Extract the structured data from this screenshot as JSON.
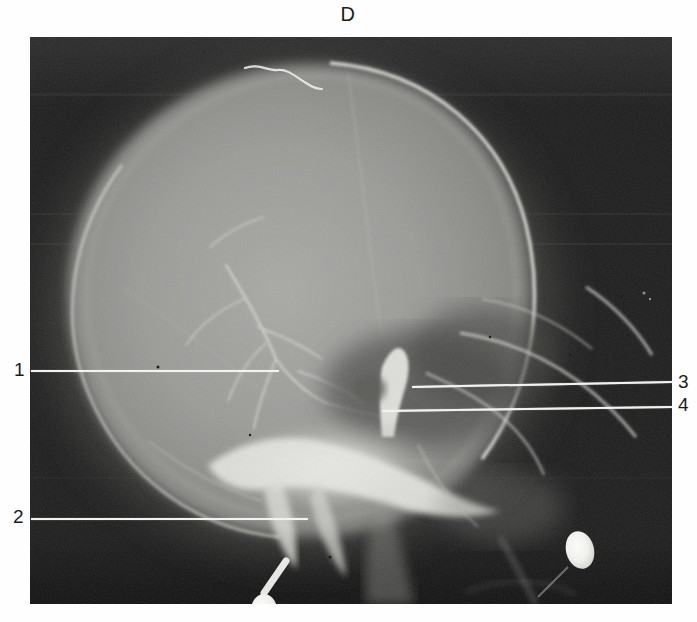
{
  "figure": {
    "panel_letter": "D",
    "modality": "lateral-skull-radiograph",
    "background_color": "#ffffff",
    "plate": {
      "x": 30,
      "y": 37,
      "width": 642,
      "height": 567,
      "film_dark_color": "#1b1b1b",
      "bone_bright_color": "#f0f0ee"
    }
  },
  "annotations": {
    "leader_color": "#f2f2ef",
    "items": [
      {
        "id": "annotation-1",
        "label": "1",
        "side": "left",
        "label_x": 14,
        "label_y": 362,
        "line_x": 31,
        "line_y": 370,
        "line_width": 248,
        "line_tilt_deg": 0.0
      },
      {
        "id": "annotation-2",
        "label": "2",
        "side": "left",
        "label_x": 13,
        "label_y": 508,
        "line_x": 31,
        "line_y": 518,
        "line_width": 277,
        "line_tilt_deg": 0.0
      },
      {
        "id": "annotation-3",
        "label": "3",
        "side": "right",
        "label_x": 678,
        "label_y": 372,
        "line_x": 412,
        "line_y": 386,
        "line_width": 260,
        "line_tilt_deg": -1.1
      },
      {
        "id": "annotation-4",
        "label": "4",
        "side": "right",
        "label_x": 678,
        "label_y": 394,
        "line_x": 382,
        "line_y": 410,
        "line_width": 290,
        "line_tilt_deg": -0.8
      }
    ]
  },
  "radiograph_features": {
    "description": "Lateral projection of a skull showing calvarium, vascular groove markings, skull base, sella region, facial bones and two dense radio-opaque markers near the skull base.",
    "regions": [
      {
        "name": "cranial-vault",
        "brightness": "mid-grey"
      },
      {
        "name": "frontal-bone",
        "brightness": "mid-grey"
      },
      {
        "name": "occipital-bone",
        "brightness": "mid-grey"
      },
      {
        "name": "skull-base-petrous",
        "brightness": "bright"
      },
      {
        "name": "sella-turcica",
        "brightness": "dark"
      },
      {
        "name": "orbital-roof",
        "brightness": "bright-line"
      },
      {
        "name": "mastoid-region",
        "brightness": "bright"
      },
      {
        "name": "vascular-groove-markings",
        "brightness": "bright-thin-lines"
      },
      {
        "name": "cervical-spine",
        "brightness": "mid-grey"
      }
    ],
    "opaque_markers": [
      {
        "name": "marker-lower-left",
        "cx": 264,
        "cy": 573,
        "rx": 13,
        "ry": 16
      },
      {
        "name": "marker-lower-right",
        "cx": 580,
        "cy": 550,
        "rx": 14,
        "ry": 19
      }
    ],
    "artifact_streak": {
      "name": "emulsion-streak-top",
      "x": 245,
      "y": 68,
      "width": 68
    }
  }
}
